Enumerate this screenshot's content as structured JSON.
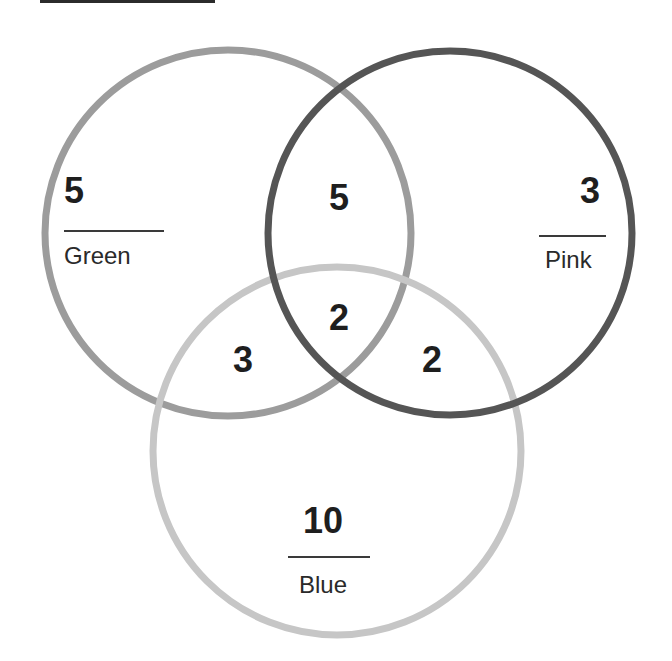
{
  "diagram": {
    "type": "venn",
    "sets": [
      {
        "key": "green",
        "label": "Green",
        "only_count": "5",
        "stroke": "#9c9c9c",
        "cx": 228,
        "cy": 233,
        "r": 183
      },
      {
        "key": "pink",
        "label": "Pink",
        "only_count": "3",
        "stroke": "#555555",
        "cx": 450,
        "cy": 233,
        "r": 182
      },
      {
        "key": "blue",
        "label": "Blue",
        "only_count": "10",
        "stroke": "#c6c6c6",
        "cx": 337,
        "cy": 451,
        "r": 184
      }
    ],
    "intersections": {
      "green_pink": "5",
      "green_blue": "3",
      "pink_blue": "2",
      "green_pink_blue": "2"
    }
  }
}
